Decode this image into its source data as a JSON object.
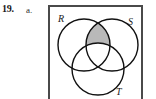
{
  "exercise": {
    "number": "19.",
    "part": "a."
  },
  "figure": {
    "type": "venn-diagram",
    "universe_label": "",
    "frame": {
      "border_color": "#4a4a4a",
      "background": "#ffffff"
    },
    "sets": [
      {
        "id": "R",
        "label": "R",
        "label_position": "top-left",
        "cx": 34,
        "cy": 40,
        "r": 26
      },
      {
        "id": "S",
        "label": "S",
        "label_position": "top-right",
        "cx": 62,
        "cy": 40,
        "r": 26
      },
      {
        "id": "T",
        "label": "T",
        "label_position": "bottom-right",
        "cx": 48,
        "cy": 64,
        "r": 26
      }
    ],
    "shaded_region": {
      "description": "R intersect S, excluding T",
      "expression": "(R ∩ S) − T",
      "fill_color": "#b9b9b9",
      "stroke_color": "#111111"
    },
    "stroke_color": "#111111",
    "stroke_width": 1.4,
    "label_color": "#1a1a1a"
  }
}
